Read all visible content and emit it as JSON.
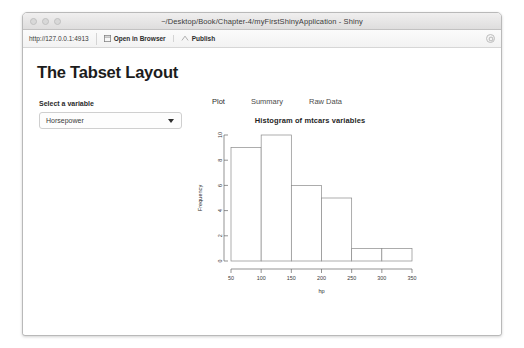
{
  "window": {
    "title": "~/Desktop/Book/Chapter-4/myFirstShinyApplication - Shiny",
    "traffic_lights": [
      "close-button",
      "minimize-button",
      "zoom-button"
    ]
  },
  "toolbar": {
    "url": "http://127.0.0.1:4913",
    "open_in_browser_label": "Open in Browser",
    "publish_label": "Publish",
    "open_in_browser_icon": "window-icon",
    "publish_icon": "upload-icon",
    "refresh_icon": "refresh-icon"
  },
  "app": {
    "page_title": "The Tabset Layout",
    "sidebar": {
      "label": "Select a variable",
      "select_value": "Horsepower",
      "select_icon": "chevron-down-icon",
      "options": [
        "Horsepower"
      ]
    },
    "tabs": [
      {
        "label": "Plot",
        "active": true
      },
      {
        "label": "Summary",
        "active": false
      },
      {
        "label": "Raw Data",
        "active": false
      }
    ]
  },
  "chart_data": {
    "type": "bar",
    "title": "Histogram of mtcars variables",
    "xlabel": "hp",
    "ylabel": "Frequency",
    "bin_edges": [
      50,
      100,
      150,
      200,
      250,
      300,
      350
    ],
    "categories": [
      "50-100",
      "100-150",
      "150-200",
      "200-250",
      "250-300",
      "300-350"
    ],
    "values": [
      9,
      10,
      6,
      5,
      1,
      1
    ],
    "xlim": [
      50,
      350
    ],
    "ylim": [
      0,
      10
    ],
    "xticks": [
      50,
      100,
      150,
      200,
      250,
      300,
      350
    ],
    "yticks": [
      0,
      2,
      4,
      6,
      8,
      10
    ],
    "grid": false,
    "legend": false,
    "bar_fill": "#ffffff",
    "bar_stroke": "#8a8a8a"
  }
}
